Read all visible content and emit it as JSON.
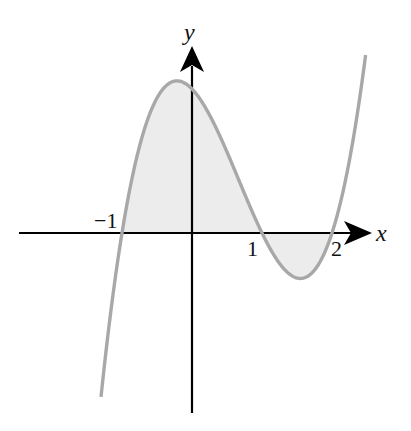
{
  "chart_data": {
    "type": "line",
    "title": "",
    "function": "y = (x+1)(x-1)(x-2)",
    "xlabel": "x",
    "ylabel": "y",
    "x_tick_labels": [
      "-1",
      "1",
      "2"
    ],
    "x_ticks": [
      -1,
      1,
      2
    ],
    "roots": [
      -1,
      1,
      2
    ],
    "shaded_region": {
      "from": -1,
      "to": 2,
      "description": "area between curve and x-axis"
    },
    "xlim": [
      -2.46,
      2.56
    ],
    "ylim": [
      -2.5,
      2.6
    ],
    "grid": false,
    "legend": null,
    "x": [
      -1.3,
      -1.0,
      -0.5,
      -0.215,
      0,
      0.5,
      1.0,
      1.5,
      1.55,
      2.0,
      2.5
    ],
    "values": [
      -1.587,
      0,
      1.875,
      2.113,
      2.0,
      1.125,
      0,
      -0.625,
      -0.631,
      0,
      2.625
    ],
    "colors": {
      "curve": "#a8a8a8",
      "fill": "#ececec",
      "axes": "#000000"
    }
  },
  "labels": {
    "x_axis": "x",
    "y_axis": "y",
    "tick_neg1": "−1",
    "tick_1": "1",
    "tick_2": "2"
  }
}
